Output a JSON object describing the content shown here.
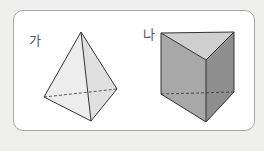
{
  "figures": [
    {
      "label": "가",
      "shape": "triangular-pyramid",
      "colors": {
        "fill_light": "#f2f2f2",
        "fill_mid": "#e3e3e3",
        "stroke": "#333333"
      }
    },
    {
      "label": "나",
      "shape": "triangular-prism",
      "colors": {
        "top": "#cfcfcf",
        "left": "#a9a9a9",
        "right": "#8d8d8d",
        "stroke": "#333333"
      }
    }
  ]
}
